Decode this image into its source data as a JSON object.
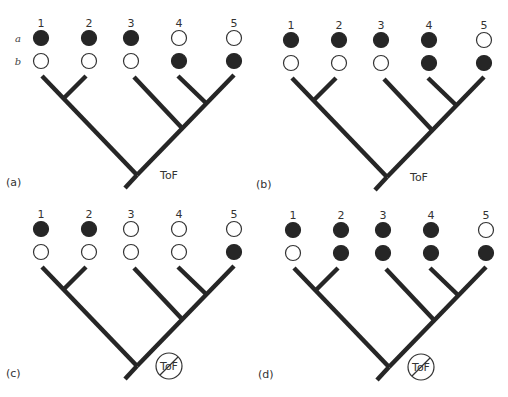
{
  "figure": {
    "row_labels": [
      "a",
      "b"
    ],
    "taxa_labels": [
      "1",
      "2",
      "3",
      "4",
      "5"
    ],
    "tree_topology": "((1,2),(3,(4,5)))",
    "root_label": "ToF",
    "state_legend": {
      "filled": "character state present",
      "empty": "character state absent"
    },
    "colors": {
      "ink": "#262626",
      "background": "#ffffff"
    },
    "panels": [
      {
        "id": "a",
        "label": "(a)",
        "root_marker": "ToF",
        "root_crossed_out": false,
        "show_row_labels": true,
        "states": {
          "a": [
            "filled",
            "filled",
            "filled",
            "empty",
            "empty"
          ],
          "b": [
            "empty",
            "empty",
            "empty",
            "filled",
            "filled"
          ]
        }
      },
      {
        "id": "b",
        "label": "(b)",
        "root_marker": "ToF",
        "root_crossed_out": false,
        "show_row_labels": false,
        "states": {
          "a": [
            "filled",
            "filled",
            "filled",
            "filled",
            "empty"
          ],
          "b": [
            "empty",
            "empty",
            "empty",
            "filled",
            "filled"
          ]
        }
      },
      {
        "id": "c",
        "label": "(c)",
        "root_marker": "ToF",
        "root_crossed_out": true,
        "show_row_labels": false,
        "states": {
          "a": [
            "filled",
            "filled",
            "empty",
            "empty",
            "empty"
          ],
          "b": [
            "empty",
            "empty",
            "empty",
            "empty",
            "filled"
          ]
        }
      },
      {
        "id": "d",
        "label": "(d)",
        "root_marker": "ToF",
        "root_crossed_out": true,
        "show_row_labels": false,
        "states": {
          "a": [
            "filled",
            "filled",
            "filled",
            "filled",
            "empty"
          ],
          "b": [
            "empty",
            "filled",
            "filled",
            "filled",
            "filled"
          ]
        }
      }
    ]
  }
}
